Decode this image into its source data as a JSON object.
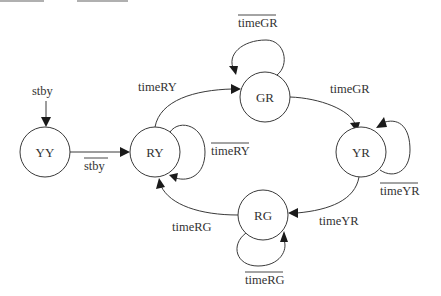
{
  "diagram": {
    "title": "",
    "type": "state-machine",
    "states": [
      {
        "id": "YY",
        "label": "YY",
        "cx": 45,
        "cy": 152
      },
      {
        "id": "RY",
        "label": "RY",
        "cx": 155,
        "cy": 152
      },
      {
        "id": "GR",
        "label": "GR",
        "cx": 265,
        "cy": 97
      },
      {
        "id": "YR",
        "label": "YR",
        "cx": 361,
        "cy": 152
      },
      {
        "id": "RG",
        "label": "RG",
        "cx": 263,
        "cy": 215
      }
    ],
    "initial": {
      "label": "stby",
      "target": "YY"
    },
    "transitions": [
      {
        "from": "YY",
        "to": "RY",
        "label": "stby",
        "negated": true
      },
      {
        "from": "RY",
        "to": "RY",
        "label": "timeRY",
        "negated": true
      },
      {
        "from": "RY",
        "to": "GR",
        "label": "timeRY",
        "negated": false
      },
      {
        "from": "GR",
        "to": "GR",
        "label": "timeGR",
        "negated": true
      },
      {
        "from": "GR",
        "to": "YR",
        "label": "timeGR",
        "negated": false
      },
      {
        "from": "YR",
        "to": "YR",
        "label": "timeYR",
        "negated": true
      },
      {
        "from": "YR",
        "to": "RG",
        "label": "timeYR",
        "negated": false
      },
      {
        "from": "RG",
        "to": "RG",
        "label": "timeRG",
        "negated": true
      },
      {
        "from": "RG",
        "to": "RY",
        "label": "timeRG",
        "negated": false
      }
    ]
  },
  "labels": {
    "init_stby": "stby",
    "yy_ry_stby": "stby",
    "ry_self": "timeRY",
    "ry_gr": "timeRY",
    "gr_self": "timeGR",
    "gr_yr": "timeGR",
    "yr_self": "timeYR",
    "yr_rg": "timeYR",
    "rg_self": "timeRG",
    "rg_ry": "timeRG",
    "state_yy": "YY",
    "state_ry": "RY",
    "state_gr": "GR",
    "state_yr": "YR",
    "state_rg": "RG"
  },
  "colors": {
    "stroke": "#3a3a3a",
    "text": "#333333",
    "background": "#ffffff"
  }
}
